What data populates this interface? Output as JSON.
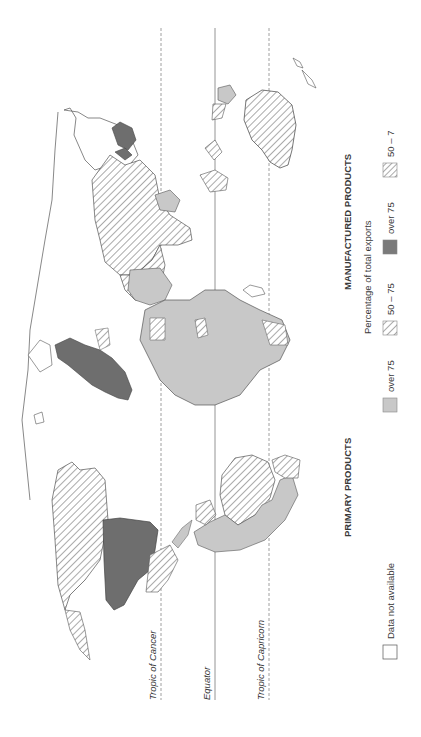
{
  "map": {
    "title_primary": "PRIMARY PRODUCTS",
    "title_manufactured": "MANUFACTURED PRODUCTS",
    "subtitle": "Percentage of total exports",
    "orientation": "rotated 90° counter-clockwise",
    "reference_lines": [
      {
        "label": "Tropic of Cancer",
        "style": "dashed"
      },
      {
        "label": "Equator",
        "style": "solid"
      },
      {
        "label": "Tropic of Capricorn",
        "style": "dashed"
      }
    ],
    "legend": {
      "primary": [
        {
          "label": "over 75",
          "fill": "light-gray",
          "color": "#c8c8c8"
        },
        {
          "label": "50 – 75",
          "fill": "hatched",
          "color": "#555555"
        }
      ],
      "manufactured": [
        {
          "label": "over 75",
          "fill": "dark-gray",
          "color": "#6e6e6e"
        },
        {
          "label": "50 – 7",
          "fill": "hatched-dense",
          "color": "#555555"
        }
      ],
      "no_data": {
        "label": "Data not available",
        "fill": "white"
      }
    },
    "regions": [
      {
        "name": "North America (Canada)",
        "category": "primary 50-75"
      },
      {
        "name": "United States",
        "category": "manufactured over 75"
      },
      {
        "name": "Mexico",
        "category": "primary 50-75"
      },
      {
        "name": "South America (Brazil)",
        "category": "primary 50-75"
      },
      {
        "name": "South America (Argentina/Bolivia)",
        "category": "primary over 75"
      },
      {
        "name": "Western Europe",
        "category": "manufactured over 75"
      },
      {
        "name": "Africa",
        "category": "primary over 75"
      },
      {
        "name": "Middle East",
        "category": "primary over 75"
      },
      {
        "name": "USSR / Northern Asia",
        "category": "primary 50-75"
      },
      {
        "name": "Japan",
        "category": "manufactured over 75"
      },
      {
        "name": "Indonesia / Southeast Asia",
        "category": "primary 50-75"
      },
      {
        "name": "Australia",
        "category": "primary 50-75"
      },
      {
        "name": "New Zealand",
        "category": "no data"
      }
    ]
  }
}
